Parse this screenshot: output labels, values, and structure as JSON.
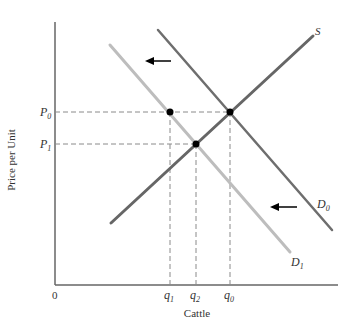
{
  "diagram": {
    "type": "supply-demand",
    "axes": {
      "y_label": "Price per Unit",
      "x_label": "Cattle",
      "origin_label": "0"
    },
    "price_labels": [
      {
        "main": "P",
        "sub": "0"
      },
      {
        "main": "P",
        "sub": "1"
      }
    ],
    "quantity_labels": [
      {
        "main": "q",
        "sub": "1"
      },
      {
        "main": "q",
        "sub": "2"
      },
      {
        "main": "q",
        "sub": "0"
      }
    ],
    "curves": {
      "supply": {
        "main": "S",
        "sub": ""
      },
      "demand_original": {
        "main": "D",
        "sub": "0"
      },
      "demand_new": {
        "main": "D",
        "sub": "1"
      }
    },
    "colors": {
      "axis": "#666666",
      "supply": "#666666",
      "demand_original": "#6e6e6e",
      "demand_new": "#bdbdbd",
      "dashed": "#8a8a8a",
      "points": "#000000",
      "arrows": "#000000"
    },
    "shift_direction": "left"
  }
}
